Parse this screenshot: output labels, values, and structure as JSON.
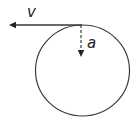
{
  "diagram": {
    "colors": {
      "stroke": "#3a3a3a",
      "text": "#222222",
      "background": "#ffffff"
    },
    "circle": {
      "cx": 82.5,
      "cy": 70.5,
      "rx": 47,
      "ry": 45.5
    },
    "vectors": [
      {
        "id": "velocity",
        "label": "v",
        "style": "solid",
        "direction": "left",
        "from": [
          82,
          25
        ],
        "to": [
          9,
          25
        ],
        "label_pos": [
          27,
          17
        ]
      },
      {
        "id": "acceleration",
        "label": "a",
        "style": "dashed",
        "direction": "down",
        "from": [
          81,
          25
        ],
        "to": [
          81,
          57
        ],
        "label_pos": [
          87,
          48
        ]
      }
    ]
  }
}
